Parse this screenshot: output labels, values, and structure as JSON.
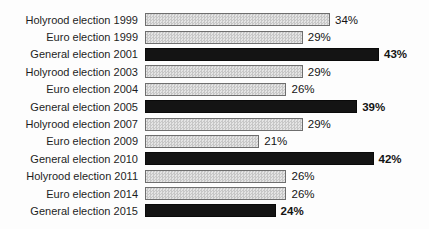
{
  "chart_data": {
    "type": "bar",
    "orientation": "horizontal",
    "title": "",
    "xlabel": "",
    "ylabel": "",
    "unit": "%",
    "xlim": [
      0,
      46
    ],
    "grid": false,
    "legend": "none",
    "categories": [
      "Holyrood election 1999",
      "Euro election 1999",
      "General election 2001",
      "Holyrood election 2003",
      "Euro election 2004",
      "General election 2005",
      "Holyrood election 2007",
      "Euro election 2009",
      "General election 2010",
      "Holyrood election 2011",
      "Euro election 2014",
      "General election 2015"
    ],
    "values": [
      34,
      29,
      43,
      29,
      26,
      39,
      29,
      21,
      42,
      26,
      26,
      24
    ],
    "value_labels": [
      "34%",
      "29%",
      "43%",
      "29%",
      "26%",
      "39%",
      "29%",
      "21%",
      "42%",
      "26%",
      "26%",
      "24%"
    ],
    "emphasized": [
      false,
      false,
      true,
      false,
      false,
      true,
      false,
      false,
      true,
      false,
      false,
      true
    ],
    "colors": {
      "bar_light_fill": "#d6d6d6",
      "bar_light_border": "#6e6e6e",
      "bar_dark_fill": "#141414",
      "text": "#1d1d1d",
      "background": "#fdfdfd"
    }
  }
}
